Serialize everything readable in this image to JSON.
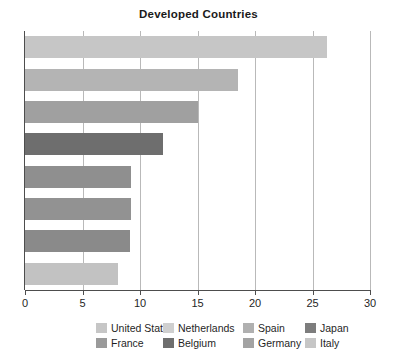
{
  "chart_data": {
    "type": "bar",
    "orientation": "horizontal",
    "title": "Developed Countries",
    "xlabel": "",
    "ylabel": "",
    "xlim": [
      0,
      30
    ],
    "xticks": [
      0,
      5,
      10,
      15,
      20,
      25,
      30
    ],
    "xtick_labels": [
      "0",
      "5",
      "10",
      "15",
      "20",
      "25",
      "30"
    ],
    "grid": "vertical",
    "legend_position": "bottom",
    "categories": [
      "United States",
      "France",
      "Netherlands",
      "Belgium",
      "Spain",
      "Germany",
      "Japan",
      "Italy"
    ],
    "values": [
      26.3,
      18.5,
      15.0,
      12.0,
      9.2,
      9.2,
      9.1,
      8.1
    ],
    "bars": [
      {
        "label": "United States",
        "value": 26.3,
        "color": "#c6c6c6"
      },
      {
        "label": "France",
        "value": 18.5,
        "color": "#b4b4b4"
      },
      {
        "label": "Netherlands",
        "value": 15.0,
        "color": "#a0a0a0"
      },
      {
        "label": "Belgium",
        "value": 12.0,
        "color": "#6e6e6e"
      },
      {
        "label": "Spain",
        "value": 9.2,
        "color": "#8f8f8f"
      },
      {
        "label": "Germany",
        "value": 9.2,
        "color": "#929292"
      },
      {
        "label": "Japan",
        "value": 9.1,
        "color": "#8a8a8a"
      },
      {
        "label": "Italy",
        "value": 8.1,
        "color": "#c2c2c2"
      }
    ],
    "legend": [
      {
        "label": "United States",
        "color": "#c6c6c6"
      },
      {
        "label": "Netherlands",
        "color": "#cfcfcf"
      },
      {
        "label": "Spain",
        "color": "#b0b0b0"
      },
      {
        "label": "Japan",
        "color": "#7d7d7d"
      },
      {
        "label": "France",
        "color": "#9a9a9a"
      },
      {
        "label": "Belgium",
        "color": "#6e6e6e"
      },
      {
        "label": "Germany",
        "color": "#a3a3a3"
      },
      {
        "label": "Italy",
        "color": "#c6c6c6"
      }
    ]
  },
  "colors": {
    "axis": "#4d4d4d",
    "grid": "#b9b9b9",
    "text": "#1f1f1f",
    "background": "#ffffff"
  }
}
